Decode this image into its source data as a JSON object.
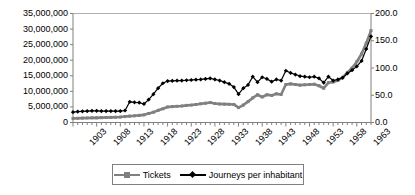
{
  "chart_data": {
    "type": "line",
    "title": "",
    "xlabel": "",
    "ylabel": "",
    "grid": false,
    "legend_position": "bottom",
    "x": [
      1903,
      1904,
      1905,
      1906,
      1907,
      1908,
      1909,
      1910,
      1911,
      1912,
      1913,
      1914,
      1915,
      1916,
      1917,
      1918,
      1919,
      1920,
      1921,
      1922,
      1923,
      1924,
      1925,
      1926,
      1927,
      1928,
      1929,
      1930,
      1931,
      1932,
      1933,
      1934,
      1935,
      1936,
      1937,
      1938,
      1939,
      1940,
      1941,
      1942,
      1943,
      1944,
      1945,
      1946,
      1947,
      1948,
      1949,
      1950,
      1951,
      1952,
      1953,
      1954,
      1955,
      1956,
      1957,
      1958,
      1959,
      1960,
      1961,
      1962,
      1963,
      1964,
      1965,
      1966
    ],
    "xticklabels": [
      "1903",
      "1908",
      "1913",
      "1918",
      "1923",
      "1928",
      "1933",
      "1938",
      "1943",
      "1948",
      "1953",
      "1958",
      "1963"
    ],
    "xtick_step_years": 5,
    "minor_ticks": "every year",
    "axes": {
      "left": {
        "label": "",
        "ticklabels": [
          "0",
          "5,000,000",
          "10,000,000",
          "15,000,000",
          "20,000,000",
          "25,000,000",
          "30,000,000",
          "35,000,000"
        ],
        "ylim": [
          0,
          35000000
        ],
        "ystep": 5000000
      },
      "right": {
        "label": "",
        "ticklabels": [
          "0.0",
          "50.0",
          "100.0",
          "150.0",
          "200.0"
        ],
        "ylim": [
          0,
          200
        ],
        "ystep": 50
      }
    },
    "series": [
      {
        "name": "Tickets",
        "axis": "left",
        "color": "#808080",
        "marker": "square",
        "values": [
          1300000,
          1350000,
          1400000,
          1450000,
          1500000,
          1500000,
          1550000,
          1600000,
          1650000,
          1700000,
          1750000,
          1900000,
          2050000,
          2150000,
          2300000,
          2450000,
          2900000,
          3300000,
          3900000,
          4400000,
          5000000,
          5100000,
          5200000,
          5300000,
          5500000,
          5600000,
          5800000,
          6000000,
          6200000,
          6400000,
          6100000,
          5950000,
          5900000,
          5850000,
          5800000,
          4800000,
          5600000,
          6700000,
          7900000,
          8900000,
          8200000,
          8900000,
          8700000,
          9200000,
          9000000,
          12200000,
          12400000,
          12200000,
          12000000,
          12100000,
          12200000,
          12300000,
          11800000,
          11000000,
          12800000,
          13000000,
          13500000,
          14500000,
          16000000,
          17500000,
          19500000,
          22000000,
          25500000,
          29500000
        ]
      },
      {
        "name": "Journeys per inhabitant",
        "axis": "right",
        "color": "#000000",
        "marker": "diamond",
        "values": [
          19,
          20,
          20.5,
          21,
          21.5,
          21.5,
          21,
          21,
          21,
          21,
          21,
          22,
          38,
          37,
          36.5,
          34,
          42,
          52,
          63,
          72,
          76,
          76.5,
          77,
          77,
          77.5,
          78,
          78.5,
          79,
          80,
          81,
          79,
          77,
          74,
          71,
          65,
          52,
          63,
          69,
          84,
          74,
          83,
          80,
          75,
          79,
          77,
          95,
          91,
          88,
          85,
          84,
          83,
          84,
          81,
          73,
          84,
          77,
          79,
          82,
          90,
          96,
          103,
          113,
          135,
          158
        ]
      }
    ]
  },
  "legend": {
    "items": [
      {
        "label": "Tickets",
        "marker": "square",
        "color": "#808080"
      },
      {
        "label": "Journeys per inhabitant",
        "marker": "diamond",
        "color": "#000000"
      }
    ]
  }
}
